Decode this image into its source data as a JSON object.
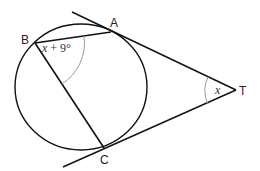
{
  "diagram": {
    "type": "geometry",
    "points": {
      "A": {
        "label": "A"
      },
      "B": {
        "label": "B"
      },
      "C": {
        "label": "C"
      },
      "T": {
        "label": "T"
      }
    },
    "angles": {
      "B": {
        "label_var": "x",
        "label_rest": " + 9°"
      },
      "T": {
        "label_var": "x"
      }
    },
    "colors": {
      "stroke": "#111111",
      "arc": "#999999",
      "background": "#ffffff"
    }
  }
}
